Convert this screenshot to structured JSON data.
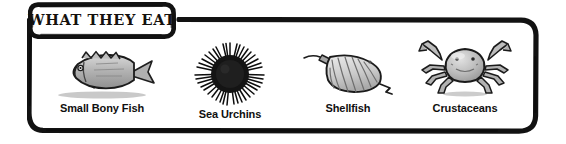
{
  "panel": {
    "title": "WHAT THEY EAT",
    "frame_color": "#111111",
    "background_color": "#ffffff",
    "text_color": "#0f0f0f"
  },
  "items": [
    {
      "label": "Small Bony Fish",
      "icon": "fish-illustration",
      "fill": "#b9b9b9",
      "outline": "#1a1a1a"
    },
    {
      "label": "Sea Urchins",
      "icon": "sea-urchin-illustration",
      "fill": "#1c1c1c",
      "outline": "#000000"
    },
    {
      "label": "Shellfish",
      "icon": "scallop-shell-illustration",
      "fill": "#cfcfcf",
      "outline": "#1a1a1a"
    },
    {
      "label": "Crustaceans",
      "icon": "crab-illustration",
      "fill": "#b5b5b5",
      "outline": "#1a1a1a"
    }
  ]
}
